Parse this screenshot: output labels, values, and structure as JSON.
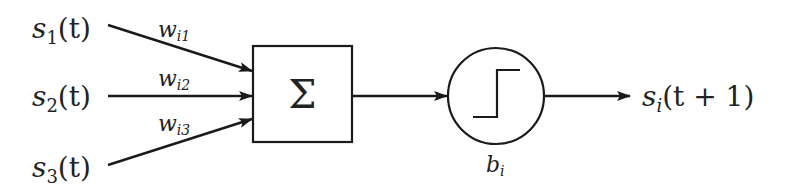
{
  "diagram": {
    "inputs": [
      {
        "name": "s",
        "sub": "1",
        "arg": "(t)",
        "weight": {
          "name": "w",
          "sub": "i1"
        }
      },
      {
        "name": "s",
        "sub": "2",
        "arg": "(t)",
        "weight": {
          "name": "w",
          "sub": "i2"
        }
      },
      {
        "name": "s",
        "sub": "3",
        "arg": "(t)",
        "weight": {
          "name": "w",
          "sub": "i3"
        }
      }
    ],
    "summation": {
      "symbol": "Σ",
      "icon": "summation-icon"
    },
    "activation": {
      "icon": "step-function-icon",
      "bias": {
        "name": "b",
        "sub": "i"
      }
    },
    "output": {
      "name": "s",
      "sub": "i",
      "arg": "(t + 1)"
    },
    "colors": {
      "stroke": "#1a1a1a",
      "background": "#ffffff",
      "text": "#222222"
    }
  }
}
